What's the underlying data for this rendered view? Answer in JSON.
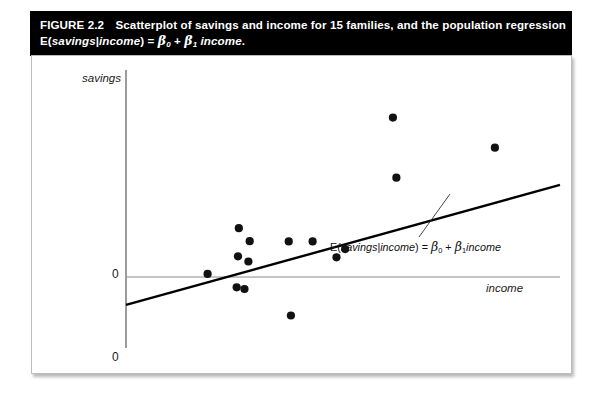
{
  "figure": {
    "number": "FIGURE 2.2",
    "title_line1_text": "Scatterplot of savings and income for 15 families, and the population regression",
    "title_line2_prefix": "E(",
    "title_line2_var1": "savings",
    "title_line2_bar": "|",
    "title_line2_var2": "income",
    "title_line2_close": ")",
    "title_line2_eq": "=",
    "title_line2_beta0": "β",
    "title_line2_beta0_sub": "0",
    "title_line2_plus": "+",
    "title_line2_beta1": "β",
    "title_line2_beta1_sub": "1",
    "title_line2_var3": "income",
    "title_line2_period": ".",
    "title_full": "FIGURE 2.2  Scatterplot of savings and income for 15 families, and the population regression E(savings|income) = β₀ + β₁ income.",
    "title_bar_color": "#000000",
    "title_text_color": "#ffffff"
  },
  "chart_data": {
    "type": "scatter",
    "title": "Scatterplot of savings and income for 15 families, and the population regression",
    "xlabel": "income",
    "ylabel": "savings",
    "n_points": 15,
    "grid": false,
    "legend": false,
    "axis_origin_label": "0",
    "y_axis_baseline_label": "0",
    "x_axis_zero_label": "0",
    "xlim": [
      0,
      100
    ],
    "ylim": [
      -40,
      100
    ],
    "points": [
      {
        "x": 18.8,
        "y": 1.5
      },
      {
        "x": 25.5,
        "y": -5.0
      },
      {
        "x": 26.0,
        "y": 23.6
      },
      {
        "x": 25.8,
        "y": 10.0
      },
      {
        "x": 27.3,
        "y": -5.8
      },
      {
        "x": 28.5,
        "y": 17.3
      },
      {
        "x": 28.2,
        "y": 7.5
      },
      {
        "x": 38.0,
        "y": -18.6
      },
      {
        "x": 37.5,
        "y": 17.2
      },
      {
        "x": 43.0,
        "y": 17.2
      },
      {
        "x": 50.5,
        "y": 13.5
      },
      {
        "x": 48.5,
        "y": 9.5
      },
      {
        "x": 61.5,
        "y": 77.0
      },
      {
        "x": 62.3,
        "y": 48.0
      },
      {
        "x": 85.0,
        "y": 62.5
      }
    ],
    "regression_line": {
      "label": "E(savings|income) = β₀ + β₁income",
      "x_start": 0,
      "y_start": -13.5,
      "x_end": 100,
      "y_end": 44.5,
      "color": "#000000"
    },
    "annotation": {
      "prefix": "E(",
      "var1": "savings",
      "bar": "|",
      "var2": "income",
      "close": ")",
      "eq": "=",
      "beta0": "β",
      "beta0_sub": "0",
      "plus": "+",
      "beta1": "β",
      "beta1_sub": "1",
      "var3": "income",
      "full": "E(savings|income) = β₀ + β₁income"
    },
    "colors": {
      "point": "#111111",
      "regression": "#000000",
      "axis": "#4a4a4a",
      "zero_line": "#8c8c8c"
    }
  }
}
